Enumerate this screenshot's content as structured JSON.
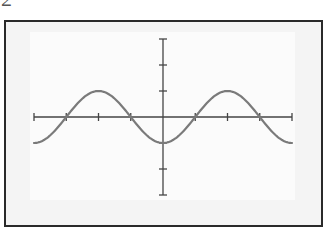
{
  "figure": {
    "label": "2",
    "frame_color": "#2a2a2a",
    "background_color": "#f4f4f4",
    "inner_background_color": "#fbfbfb"
  },
  "chart_data": {
    "type": "line",
    "title": "",
    "function": "y = -cos(pi*x/2)",
    "xlabel": "",
    "ylabel": "",
    "xlim": [
      -4,
      4
    ],
    "ylim": [
      -3,
      3
    ],
    "x_ticks": [
      -4,
      -3,
      -2,
      -1,
      0,
      1,
      2,
      3,
      4
    ],
    "y_ticks": [
      -3,
      -2,
      -1,
      0,
      1,
      2,
      3
    ],
    "tick_labels_shown": false,
    "grid": false,
    "legend": null,
    "axis_color": "#444444",
    "series": [
      {
        "name": "curve",
        "color": "#7a7a7a",
        "x": [
          -4,
          -3.5,
          -3,
          -2.5,
          -2,
          -1.5,
          -1,
          -0.5,
          0,
          0.5,
          1,
          1.5,
          2,
          2.5,
          3,
          3.5,
          4
        ],
        "y": [
          -1,
          -0.71,
          0,
          0.71,
          1,
          0.71,
          0,
          -0.71,
          -1,
          -0.71,
          0,
          0.71,
          1,
          0.71,
          0,
          -0.71,
          -1
        ]
      }
    ],
    "zero_crossings": [
      -3,
      -1,
      1,
      3
    ],
    "maxima": [
      [
        -2,
        1
      ],
      [
        2,
        1
      ]
    ],
    "minima": [
      [
        -4,
        -1
      ],
      [
        0,
        -1
      ],
      [
        4,
        -1
      ]
    ]
  }
}
